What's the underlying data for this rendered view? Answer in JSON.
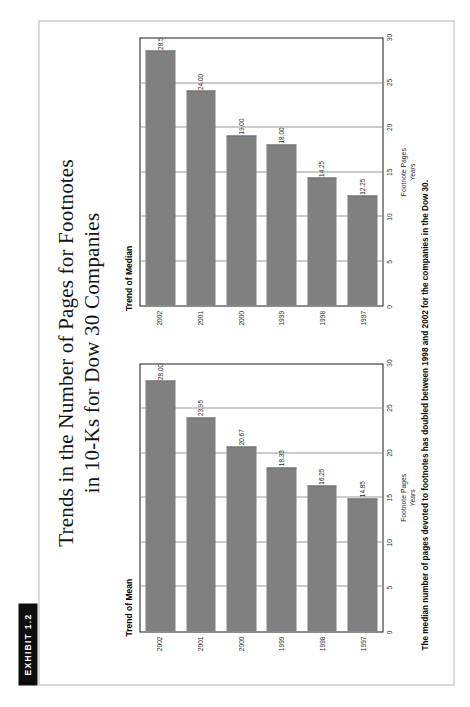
{
  "exhibit": {
    "label": "EXHIBIT 1.2"
  },
  "title": {
    "line1": "Trends in the Number of Pages for Footnotes",
    "line2": "in 10-Ks for Dow 30 Companies"
  },
  "caption": "The median number of pages devoted to footnotes has doubled between 1998 and 2002 for the companies in the Dow 30.",
  "axis": {
    "value_ticks": [
      "0",
      "5",
      "10",
      "15",
      "20",
      "25",
      "30"
    ],
    "value_axis_title": "Footnote Pages",
    "category_axis_title": "Years",
    "years": [
      "1997",
      "1998",
      "1999",
      "2000",
      "2001",
      "2002"
    ]
  },
  "colors": {
    "bar": "#808080",
    "plot_border": "#1b1b1b",
    "gridline": "#9a9a9a",
    "frame": "#b9b9b9",
    "exhibit_tab_bg": "#0d0d0d",
    "exhibit_tab_fg": "#ffffff"
  },
  "chart_data": [
    {
      "type": "bar",
      "title": "Trend of Mean",
      "orientation": "vertical",
      "categories": [
        "1997",
        "1998",
        "1999",
        "2000",
        "2001",
        "2002"
      ],
      "values": [
        14.85,
        16.25,
        18.33,
        20.67,
        23.95,
        28.0
      ],
      "data_labels": [
        "14.85",
        "16.25",
        "18.33",
        "20.67",
        "23.95",
        "28.00"
      ],
      "xlabel": "Years",
      "ylabel": "Footnote Pages",
      "ylim": [
        0,
        30
      ],
      "yticks": [
        0,
        5,
        10,
        15,
        20,
        25,
        30
      ],
      "grid": true,
      "legend": false
    },
    {
      "type": "bar",
      "title": "Trend of Median",
      "orientation": "vertical",
      "categories": [
        "1997",
        "1998",
        "1999",
        "2000",
        "2001",
        "2002"
      ],
      "values": [
        12.25,
        14.25,
        18.0,
        19.0,
        24.0,
        28.5
      ],
      "data_labels": [
        "12.25",
        "14.25",
        "18.00",
        "19.00",
        "24.00",
        "28.50"
      ],
      "xlabel": "Years",
      "ylabel": "Footnote Pages",
      "ylim": [
        0,
        30
      ],
      "yticks": [
        0,
        5,
        10,
        15,
        20,
        25,
        30
      ],
      "grid": true,
      "legend": false
    }
  ]
}
